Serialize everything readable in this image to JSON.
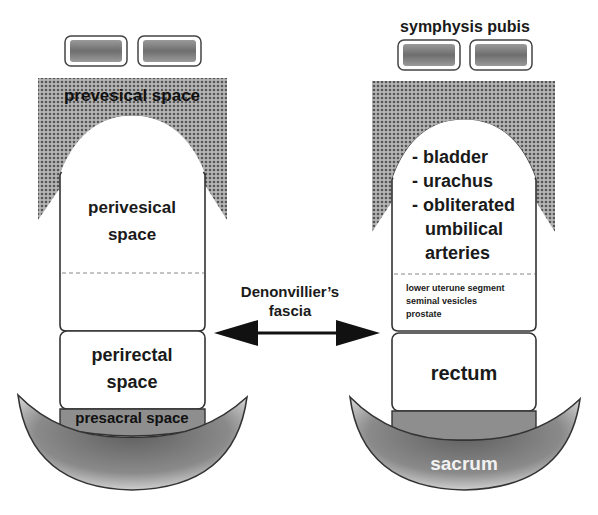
{
  "diagram": {
    "type": "anatomical-schematic",
    "colors": {
      "stipple_dark": "#6a6a6a",
      "stipple_bg": "#a9a9a9",
      "presacral_fill": "#8c8c8c",
      "outline": "#333333",
      "text": "#1a1a1a",
      "bone_light": "#e8e8e8",
      "bone_dark": "#7a7a7a"
    },
    "left_panel": {
      "prevesical_label": "prevesical space",
      "perivesical_label_line1": "perivesical",
      "perivesical_label_line2": "space",
      "perirectal_label_line1": "perirectal",
      "perirectal_label_line2": "space",
      "presacral_label": "presacral space"
    },
    "right_panel": {
      "symphysis_label": "symphysis pubis",
      "bladder_items": [
        "- bladder",
        "- urachus",
        "- obliterated",
        "umbilical",
        "arteries"
      ],
      "middle_items": [
        "lower uterune segment",
        "seminal vesicles",
        "prostate"
      ],
      "rectum_label": "rectum",
      "sacrum_label": "sacrum"
    },
    "center": {
      "fascia_label_line1": "Denonvillier’s",
      "fascia_label_line2": "fascia",
      "arrow": "double-headed-arrow"
    }
  }
}
